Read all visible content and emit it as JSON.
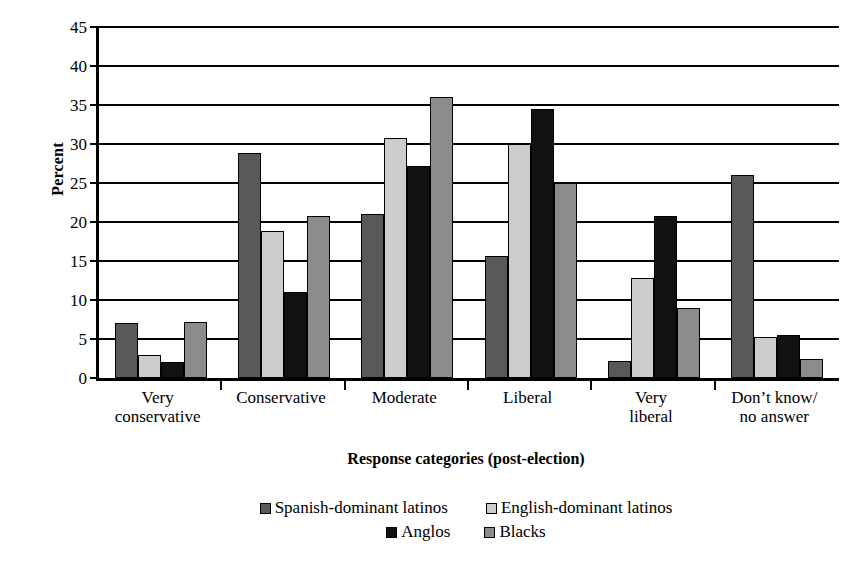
{
  "chart_data": {
    "type": "bar",
    "title": "",
    "xlabel": "Response categories (post-election)",
    "ylabel": "Percent",
    "ylim": [
      0,
      45
    ],
    "yticks": [
      0,
      5,
      10,
      15,
      20,
      25,
      30,
      35,
      40,
      45
    ],
    "grid": true,
    "legend_position": "bottom",
    "categories": [
      "Very conservative",
      "Conservative",
      "Moderate",
      "Liberal",
      "Very liberal",
      "Don’t know/ no answer"
    ],
    "category_lines": [
      [
        "Very",
        "conservative"
      ],
      [
        "Conservative"
      ],
      [
        "Moderate"
      ],
      [
        "Liberal"
      ],
      [
        "Very",
        "liberal"
      ],
      [
        "Don’t know/",
        "no answer"
      ]
    ],
    "series": [
      {
        "name": "Spanish-dominant latinos",
        "color": "#595959",
        "values": [
          7.0,
          28.8,
          21.0,
          15.7,
          2.2,
          26.0
        ]
      },
      {
        "name": "English-dominant latinos",
        "color": "#cccccc",
        "values": [
          3.0,
          18.9,
          30.8,
          30.0,
          12.8,
          5.2
        ]
      },
      {
        "name": "Anglos",
        "color": "#111111",
        "values": [
          2.0,
          11.0,
          27.2,
          34.5,
          20.8,
          5.5
        ]
      },
      {
        "name": "Blacks",
        "color": "#8c8c8c",
        "values": [
          7.2,
          20.8,
          36.0,
          25.0,
          9.0,
          2.4
        ]
      }
    ]
  },
  "legend": {
    "rows": [
      [
        "Spanish-dominant latinos",
        "English-dominant latinos"
      ],
      [
        "Anglos",
        "Blacks"
      ]
    ]
  }
}
